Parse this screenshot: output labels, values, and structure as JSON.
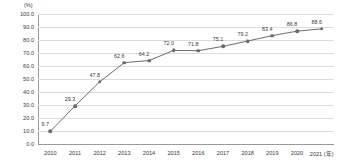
{
  "chart_data": {
    "type": "line",
    "title": "",
    "xlabel": "(年)",
    "ylabel": "(%)",
    "unit_label": "(%)",
    "x_axis_suffix": "(年)",
    "categories": [
      "2010",
      "2011",
      "2012",
      "2013",
      "2014",
      "2015",
      "2016",
      "2017",
      "2018",
      "2019",
      "2020",
      "2021"
    ],
    "values": [
      9.7,
      29.3,
      47.8,
      62.6,
      64.2,
      72.0,
      71.8,
      75.1,
      79.2,
      83.4,
      86.8,
      88.6
    ],
    "point_labels": [
      "9.7",
      "29.3",
      "47.8",
      "62.6",
      "64.2",
      "72.0",
      "71.8",
      "75.1",
      "79.2",
      "83.4",
      "86.8",
      "88.6"
    ],
    "ylim": [
      0.0,
      100.0
    ],
    "ytick_values": [
      100.0,
      90.0,
      80.0,
      70.0,
      60.0,
      50.0,
      40.0,
      30.0,
      20.0,
      10.0,
      0.0
    ],
    "ytick_labels": [
      "100.0",
      "90.0",
      "80.0",
      "70.0",
      "60.0",
      "50.0",
      "40.0",
      "30.0",
      "20.0",
      "10.0",
      "0.0"
    ],
    "grid": true,
    "legend": false,
    "legend_position": "none",
    "series_color": "#6b6b6b",
    "grid_color": "#dcdcdc",
    "axis_color": "#9a9a9a",
    "text_color": "#3a3a3a"
  }
}
